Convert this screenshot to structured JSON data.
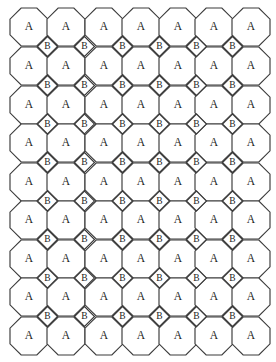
{
  "figure": {
    "width": 276,
    "height": 362,
    "background_color": "#ffffff",
    "stroke_color": "#3a3a3a",
    "label_color": "#1c1c1c"
  },
  "tiling": {
    "type": "truncated-square-tiling",
    "vertex_configuration": "4.8.8",
    "prototiles": [
      {
        "id": "A",
        "label": "A",
        "shape": "octagon",
        "sides": 8,
        "width_px": 38,
        "height_px": 38,
        "count": 63
      },
      {
        "id": "B",
        "label": "B",
        "shape": "square",
        "sides": 4,
        "rotation_deg": 45,
        "diagonal_px": 20,
        "count": 48
      }
    ],
    "lattice": {
      "x_period": 37.0,
      "y_period": 38.6,
      "octagon_origin_x": 29,
      "octagon_origin_y": 27,
      "octagon_columns": 7,
      "octagon_rows": 9,
      "square_offset_x": 18.5,
      "square_offset_y": 19.3,
      "square_columns": 6,
      "square_rows": 8
    },
    "octagon_centers_x": [
      29,
      66,
      104,
      141,
      178,
      214,
      251
    ],
    "octagon_centers_y": [
      27,
      66,
      105,
      143,
      182,
      220,
      259,
      297,
      336
    ],
    "square_centers_x": [
      47.5,
      84.5,
      122.5,
      159.5,
      196.5,
      232.5
    ],
    "square_centers_y": [
      46.5,
      85.5,
      124,
      162.5,
      201,
      239.5,
      278,
      316.5
    ]
  }
}
